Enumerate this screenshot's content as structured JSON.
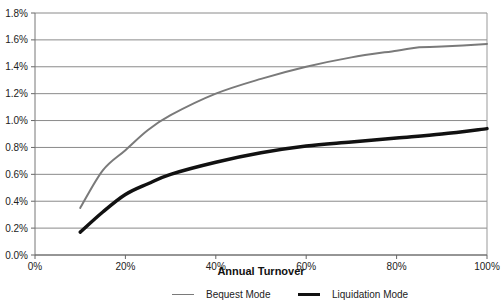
{
  "chart_data": {
    "type": "line",
    "title": "",
    "xlabel": "Annual Turnover",
    "ylabel": "",
    "xlim": [
      0,
      100
    ],
    "ylim": [
      0,
      1.8
    ],
    "grid": true,
    "legend_position": "bottom",
    "x_ticks": [
      "0%",
      "20%",
      "40%",
      "60%",
      "80%",
      "100%"
    ],
    "y_ticks": [
      "0.0%",
      "0.2%",
      "0.4%",
      "0.6%",
      "0.8%",
      "1.0%",
      "1.2%",
      "1.4%",
      "1.6%",
      "1.8%"
    ],
    "series": [
      {
        "name": "Bequest Mode",
        "color": "#7a7a7a",
        "line_width": 2,
        "x": [
          10,
          15,
          20,
          25,
          30,
          40,
          50,
          60,
          70,
          80,
          85,
          90,
          100
        ],
        "values": [
          0.35,
          0.63,
          0.78,
          0.93,
          1.04,
          1.2,
          1.31,
          1.4,
          1.47,
          1.52,
          1.545,
          1.55,
          1.57
        ]
      },
      {
        "name": "Liquidation Mode",
        "color": "#111111",
        "line_width": 3.5,
        "x": [
          10,
          15,
          20,
          25,
          30,
          40,
          50,
          60,
          70,
          80,
          90,
          100
        ],
        "values": [
          0.17,
          0.32,
          0.45,
          0.53,
          0.6,
          0.69,
          0.76,
          0.81,
          0.84,
          0.87,
          0.9,
          0.94
        ]
      }
    ]
  },
  "legend": {
    "items": [
      {
        "label": "Bequest Mode"
      },
      {
        "label": "Liquidation Mode"
      }
    ]
  }
}
